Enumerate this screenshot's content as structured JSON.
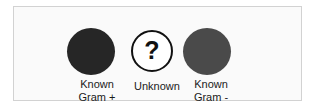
{
  "figure": {
    "name": "bacterial-gram-stain-comparison",
    "background_color": "#ffffff",
    "panel_background_color": "#fafafa",
    "frame_color": "#d2d2d2"
  },
  "specimens": [
    {
      "id": "known-gram-positive",
      "shape": "circle",
      "fill": "solid",
      "fill_color": "#262626",
      "symbol": "",
      "caption_line_1": "Known",
      "caption_line_2": "Gram +"
    },
    {
      "id": "unknown",
      "shape": "circle",
      "fill": "outline",
      "fill_color": "#ffffff",
      "outline_color": "#111111",
      "symbol": "?",
      "caption_line_1": "Unknown",
      "caption_line_2": ""
    },
    {
      "id": "known-gram-negative",
      "shape": "circle",
      "fill": "solid",
      "fill_color": "#4a4a4a",
      "symbol": "",
      "caption_line_1": "Known",
      "caption_line_2": "Gram -"
    }
  ]
}
